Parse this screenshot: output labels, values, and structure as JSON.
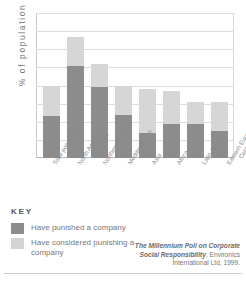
{
  "chart_data": {
    "type": "bar",
    "title": "",
    "xlabel": "",
    "ylabel": "% of population",
    "ylim": [
      0,
      80
    ],
    "yticks": [
      0,
      10,
      20,
      30,
      40,
      50,
      60,
      70,
      80
    ],
    "grid": true,
    "stacked": true,
    "legend_position": "below-left",
    "categories": [
      "Total population",
      "North America/\nOceania",
      "Northern Europe",
      "Mediterranean",
      "Asia",
      "Africa",
      "Latin America",
      "Eastern Europe/\nCentral Asia"
    ],
    "series": [
      {
        "name": "Have punished a company",
        "color": "#8c8c8c",
        "values": [
          23,
          51,
          39,
          24,
          14,
          19,
          19,
          15
        ]
      },
      {
        "name": "Have considered punishing a company",
        "color": "#d6d6d6",
        "values": [
          17,
          16,
          13,
          16,
          24,
          18,
          12,
          16
        ]
      }
    ],
    "totals": [
      40,
      67,
      52,
      40,
      38,
      37,
      31,
      31
    ],
    "annotations": [
      "The Millennium Poll on Corporate Social Responsibility, Environics International Ltd, 1999."
    ]
  },
  "axis": {
    "y_title": "% of population",
    "ticks": [
      "80",
      "70",
      "60",
      "50",
      "40",
      "30",
      "20",
      "10",
      "0"
    ]
  },
  "categories": [
    {
      "line1": "Total population",
      "line2": ""
    },
    {
      "line1": "North America/",
      "line2": "Oceania"
    },
    {
      "line1": "Northern Europe",
      "line2": ""
    },
    {
      "line1": "Mediterranean",
      "line2": ""
    },
    {
      "line1": "Asia",
      "line2": ""
    },
    {
      "line1": "Africa",
      "line2": ""
    },
    {
      "line1": "Latin America",
      "line2": ""
    },
    {
      "line1": "Eastern Europe/",
      "line2": "Central Asia"
    }
  ],
  "key": {
    "title": "KEY",
    "items": [
      {
        "label": "Have punished a company",
        "color": "#8c8c8c"
      },
      {
        "label": "Have considered punishing a company",
        "color": "#d4d4d4"
      }
    ]
  },
  "source": {
    "italic_part": "The Millennium Poll on Corporate Social Responsibility",
    "rest_part": ", Environics International Ltd, 1999."
  }
}
